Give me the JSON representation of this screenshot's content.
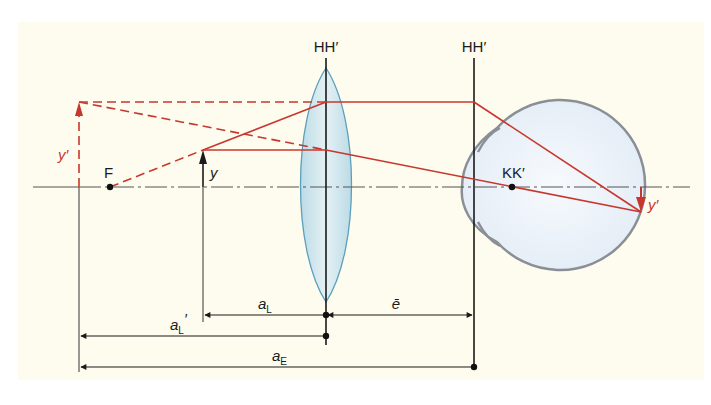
{
  "diagram": {
    "colors": {
      "background": "#fdfcee",
      "page": "#ffffff",
      "ray": "#c8372d",
      "line": "#1a1a1a",
      "axis": "#555555",
      "lens_fill": "#cfe6ee",
      "lens_stroke": "#5b9fbd",
      "eye_fill": "#eef4fb",
      "eye_stroke": "#8a8f96"
    },
    "labels": {
      "lens_planes": "HH′",
      "eye_planes": "HH′",
      "focal_point": "F",
      "object": "y",
      "virtual_image": "y′",
      "retinal_image": "y′",
      "nodal_point": "KK′",
      "dim_aL_base": "a",
      "dim_aL_sub": "L",
      "dim_aLprime_base": "a",
      "dim_aLprime_sub": "L",
      "dim_aLprime_mark": "′",
      "dim_e": "ē",
      "dim_aE_base": "a",
      "dim_aE_sub": "E"
    },
    "elements": {
      "optical_axis": {
        "x1": 33,
        "x2": 690,
        "y": 187
      },
      "lens": {
        "cx": 326,
        "top": 68,
        "bottom": 302,
        "half_width": 26
      },
      "lens_plane_line": {
        "x": 326,
        "y1": 58,
        "y2": 345
      },
      "eye_plane_line": {
        "x": 474,
        "y1": 58,
        "y2": 367
      },
      "eye": {
        "cx": 563,
        "cy": 185,
        "r": 85,
        "cornea_left": 462
      },
      "focal_point": {
        "x": 110,
        "y": 187
      },
      "nodal_point": {
        "x": 512,
        "y": 187
      },
      "object_arrow": {
        "x": 203,
        "y_base": 187,
        "y_tip": 150
      },
      "virtual_image_arrow": {
        "x": 79,
        "y_base": 187,
        "y_tip": 102
      },
      "retinal_image_arrow": {
        "x": 641,
        "y_base": 187,
        "y_tip": 212
      }
    },
    "dimensions": [
      {
        "name": "a_L",
        "from_x": 203,
        "to_x": 326,
        "y": 315,
        "arrow": "left"
      },
      {
        "name": "e_bar",
        "from_x": 326,
        "to_x": 474,
        "y": 315,
        "arrow": "both"
      },
      {
        "name": "a_L_prime",
        "from_x": 79,
        "to_x": 326,
        "y": 336,
        "arrow": "left"
      },
      {
        "name": "a_E",
        "from_x": 79,
        "to_x": 474,
        "y": 367,
        "arrow": "left"
      }
    ]
  }
}
